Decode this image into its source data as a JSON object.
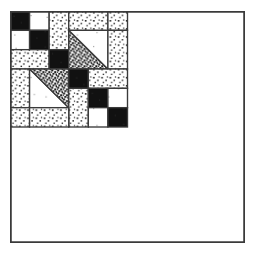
{
  "figure": {
    "kind": "quilt-block-diagram",
    "title": "",
    "caption": "",
    "canvas": {
      "width": 256,
      "height": 253
    },
    "block": {
      "x": 10,
      "y": 11,
      "width": 235,
      "height": 232,
      "grid_units": 8
    },
    "fills": {
      "black": "#111111",
      "white": "#ffffff",
      "light_stipple": "#ffffff",
      "dark_stipple": "#ffffff",
      "outline": "#3a3a3a",
      "background": "#ffffff"
    },
    "legend": [
      {
        "name": "black",
        "label": "solid dark fabric"
      },
      {
        "name": "white",
        "label": "plain light fabric"
      },
      {
        "name": "light-stipple",
        "label": "light print fabric"
      },
      {
        "name": "dark-stipple",
        "label": "dark print fabric"
      }
    ],
    "patches": [
      {
        "id": "p01",
        "name": "patch-black-r1c1",
        "shape": "square",
        "fill": "black",
        "u": 0,
        "v": 0,
        "w": 2,
        "h": 2
      },
      {
        "id": "p02",
        "name": "patch-white-r1c2",
        "shape": "square",
        "fill": "white",
        "u": 2,
        "v": 0,
        "w": 2,
        "h": 2
      },
      {
        "id": "p03",
        "name": "patch-white-r2c1",
        "shape": "square",
        "fill": "white",
        "u": 0,
        "v": 2,
        "w": 2,
        "h": 2
      },
      {
        "id": "p04",
        "name": "patch-black-r2c2",
        "shape": "square",
        "fill": "black",
        "u": 2,
        "v": 2,
        "w": 2,
        "h": 2
      },
      {
        "id": "p05",
        "name": "patch-light-print-top-center",
        "shape": "square",
        "fill": "light-stipple",
        "u": 4,
        "v": 0,
        "w": 2,
        "h": 4
      },
      {
        "id": "p06",
        "name": "patch-light-print-top-right-upper",
        "shape": "square",
        "fill": "light-stipple",
        "u": 6,
        "v": 0,
        "w": 4,
        "h": 2
      },
      {
        "id": "p07",
        "name": "patch-light-print-right-column",
        "shape": "square",
        "fill": "light-stipple",
        "u": 10,
        "v": 0,
        "w": 2,
        "h": 2
      },
      {
        "id": "p08",
        "name": "patch-light-print-left-mid",
        "shape": "square",
        "fill": "light-stipple",
        "u": 0,
        "v": 4,
        "w": 4,
        "h": 2
      },
      {
        "id": "p09",
        "name": "patch-black-center-upper",
        "shape": "square",
        "fill": "black",
        "u": 4,
        "v": 4,
        "w": 2,
        "h": 2
      },
      {
        "id": "p10",
        "name": "triangle-dark-print-top-right",
        "shape": "triangle",
        "fill": "dark-stipple",
        "u": 6,
        "v": 2,
        "w": 4,
        "h": 4,
        "orientation": "lower-left"
      },
      {
        "id": "p11",
        "name": "triangle-white-top-right",
        "shape": "triangle",
        "fill": "white",
        "u": 6,
        "v": 2,
        "w": 4,
        "h": 4,
        "orientation": "upper-right"
      },
      {
        "id": "p12",
        "name": "patch-light-print-right-mid",
        "shape": "square",
        "fill": "light-stipple",
        "u": 10,
        "v": 2,
        "w": 2,
        "h": 4
      },
      {
        "id": "p13",
        "name": "patch-light-print-left-lower",
        "shape": "square",
        "fill": "light-stipple",
        "u": 0,
        "v": 6,
        "w": 2,
        "h": 4
      },
      {
        "id": "p14",
        "name": "triangle-white-bottom-left",
        "shape": "triangle",
        "fill": "white",
        "u": 2,
        "v": 6,
        "w": 4,
        "h": 4,
        "orientation": "lower-left"
      },
      {
        "id": "p15",
        "name": "triangle-dark-print-bottom-left",
        "shape": "triangle",
        "fill": "dark-stipple",
        "u": 2,
        "v": 6,
        "w": 4,
        "h": 4,
        "orientation": "upper-right"
      },
      {
        "id": "p16",
        "name": "patch-black-center-lower",
        "shape": "square",
        "fill": "black",
        "u": 6,
        "v": 6,
        "w": 2,
        "h": 2
      },
      {
        "id": "p17",
        "name": "patch-light-print-right-lower",
        "shape": "square",
        "fill": "light-stipple",
        "u": 8,
        "v": 6,
        "w": 4,
        "h": 2
      },
      {
        "id": "p18",
        "name": "patch-light-print-center-bottom",
        "shape": "square",
        "fill": "light-stipple",
        "u": 6,
        "v": 8,
        "w": 2,
        "h": 4
      },
      {
        "id": "p19",
        "name": "patch-black-lower-right",
        "shape": "square",
        "fill": "black",
        "u": 8,
        "v": 8,
        "w": 2,
        "h": 2
      },
      {
        "id": "p20",
        "name": "patch-white-lower-right",
        "shape": "square",
        "fill": "white",
        "u": 10,
        "v": 8,
        "w": 2,
        "h": 2
      },
      {
        "id": "p21",
        "name": "patch-white-bottom-right-inner",
        "shape": "square",
        "fill": "white",
        "u": 8,
        "v": 10,
        "w": 2,
        "h": 2
      },
      {
        "id": "p22",
        "name": "patch-black-bottom-right-corner",
        "shape": "square",
        "fill": "black",
        "u": 10,
        "v": 10,
        "w": 2,
        "h": 2
      },
      {
        "id": "p23",
        "name": "patch-light-print-bottom-left",
        "shape": "square",
        "fill": "light-stipple",
        "u": 0,
        "v": 10,
        "w": 2,
        "h": 2
      },
      {
        "id": "p24",
        "name": "patch-light-print-bottom-center",
        "shape": "square",
        "fill": "light-stipple",
        "u": 2,
        "v": 10,
        "w": 4,
        "h": 2
      }
    ]
  }
}
